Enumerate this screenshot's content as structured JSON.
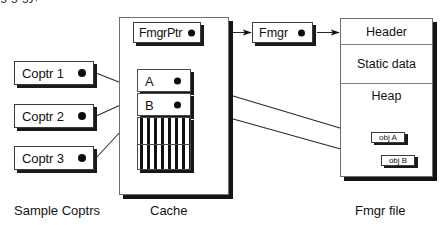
{
  "diagram": {
    "columns": {
      "left_caption": "Sample Coptrs",
      "middle_caption": "Cache",
      "right_caption": "Fmgr file"
    },
    "coptrs": [
      {
        "id": "coptr-1",
        "label": "Coptr 1"
      },
      {
        "id": "coptr-2",
        "label": "Coptr 2"
      },
      {
        "id": "coptr-3",
        "label": "Coptr 3"
      }
    ],
    "cache": {
      "fmgr_ptr_label": "FmgrPtr",
      "buckets_label": "Buckets",
      "buckets": [
        {
          "id": "bucket-a",
          "label": "A"
        },
        {
          "id": "bucket-b",
          "label": "B"
        }
      ],
      "empty_buckets_fill": "hatched"
    },
    "fmgr": {
      "label": "Fmgr"
    },
    "fmgr_file": {
      "segments": [
        {
          "id": "seg-header",
          "label": "Header"
        },
        {
          "id": "seg-static",
          "label": "Static data"
        },
        {
          "id": "seg-heap",
          "label": "Heap"
        }
      ],
      "objects": [
        {
          "id": "obj-a",
          "label": "obj A"
        },
        {
          "id": "obj-b",
          "label": "obj B"
        }
      ]
    },
    "colors": {
      "ink": "#121212",
      "line": "#2a2a2a",
      "shadow": "#1a1a1a",
      "panel_border": "#6f6f6f",
      "background": "#ffffff"
    }
  }
}
